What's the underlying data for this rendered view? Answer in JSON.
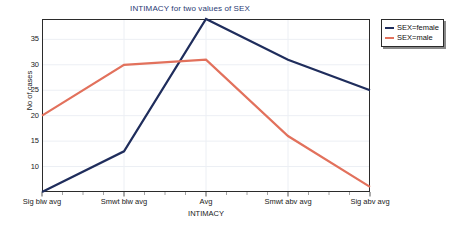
{
  "chart_data": {
    "type": "line",
    "title": "INTIMACY for two values of SEX",
    "xlabel": "INTIMACY",
    "ylabel": "No of cases",
    "categories": [
      "Sig blw avg",
      "Smwt blw avg",
      "Avg",
      "Smwt abv avg",
      "Sig abv avg"
    ],
    "yticks": [
      10,
      15,
      20,
      25,
      30,
      35
    ],
    "ylim": [
      5,
      39
    ],
    "grid": true,
    "legend_position": "top-right",
    "series": [
      {
        "name": "SEX=female",
        "color": "#1f2d5c",
        "values": [
          5,
          13,
          39,
          31,
          25
        ]
      },
      {
        "name": "SEX=male",
        "color": "#e2715c",
        "values": [
          20,
          30,
          31,
          16,
          6
        ]
      }
    ]
  },
  "legend": {
    "items": [
      {
        "label": "SEX=female"
      },
      {
        "label": "SEX=male"
      }
    ]
  },
  "colors": {
    "title": "#2a3a73",
    "female": "#1f2d5c",
    "male": "#e2715c",
    "frame": "#2b2b2b",
    "grid": "#eceff4"
  }
}
